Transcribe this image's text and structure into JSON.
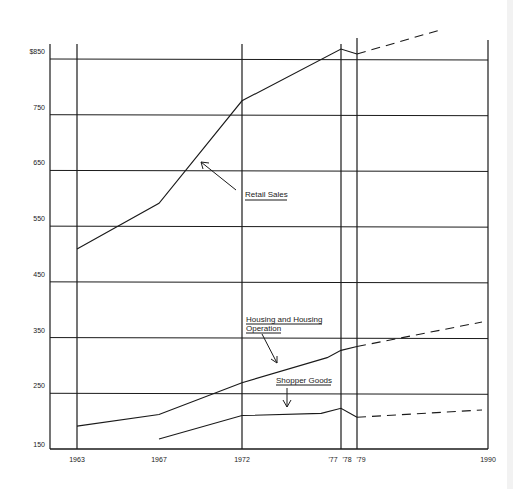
{
  "chart_data": {
    "type": "line",
    "title": "",
    "xlabel": "",
    "ylabel": "",
    "ylim": [
      150,
      850
    ],
    "yticks": [
      "$850",
      "750",
      "650",
      "550",
      "450",
      "350",
      "250",
      "150"
    ],
    "ytick_values": [
      850,
      750,
      650,
      550,
      450,
      350,
      250,
      150
    ],
    "xticks": [
      "1963",
      "1967",
      "1972",
      "'77",
      "'78",
      "'79",
      "1990"
    ],
    "xtick_values": [
      1963,
      1967,
      1972,
      1977,
      1978,
      1979,
      1990
    ],
    "grid": true,
    "series": [
      {
        "name": "Retail Sales",
        "actual": {
          "x": [
            1963,
            1967,
            1972,
            1977,
            1978
          ],
          "y": [
            509,
            591,
            775,
            868,
            859
          ]
        },
        "projected": {
          "x": [
            1978,
            1985
          ],
          "y": [
            859,
            893
          ]
        }
      },
      {
        "name": "Housing and Housing Operation",
        "actual": {
          "x": [
            1963,
            1967,
            1972,
            1976.3,
            1977,
            1978
          ],
          "y": [
            191,
            212,
            269,
            314,
            327,
            334
          ]
        },
        "projected": {
          "x": [
            1978,
            1990
          ],
          "y": [
            334,
            375
          ]
        }
      },
      {
        "name": "Shopper Goods",
        "actual": {
          "x": [
            1967,
            1972,
            1976,
            1977,
            1978
          ],
          "y": [
            168,
            210,
            214,
            223,
            207
          ]
        },
        "projected": {
          "x": [
            1978,
            1990
          ],
          "y": [
            207,
            219
          ]
        }
      }
    ],
    "annotations": [
      {
        "text": "Retail Sales",
        "underlined": true,
        "arrow_to": "Retail Sales line near 1969"
      },
      {
        "text": "Housing and Housing Operation",
        "underlined": true,
        "arrow_to": "Housing line near 1974"
      },
      {
        "text": "Shopper Goods",
        "underlined": true,
        "arrow_to": "Shopper Goods line near 1974"
      }
    ]
  },
  "labels": {
    "retail": "Retail Sales",
    "housing_line1": "Housing and Housing",
    "housing_line2": "Operation",
    "shopper": "Shopper Goods"
  },
  "colors": {
    "ink": "#1a1a1a",
    "background": "#ffffff"
  }
}
